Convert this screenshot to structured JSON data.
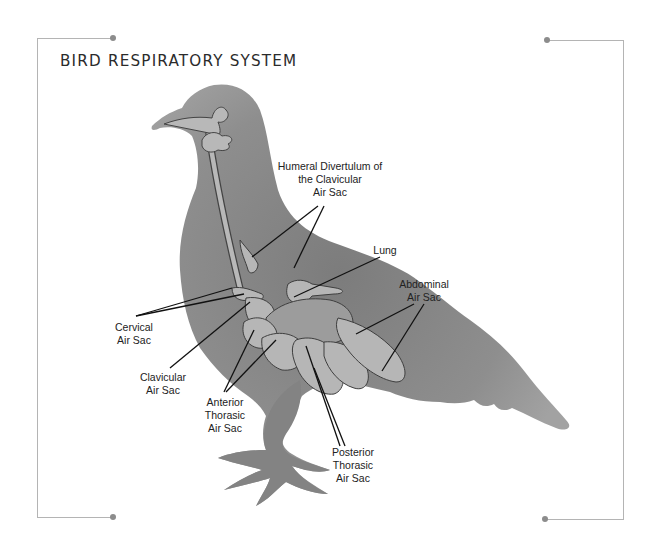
{
  "title": "BIRD RESPIRATORY SYSTEM",
  "colors": {
    "bird_body": "#8e8e8e",
    "bird_dark": "#7a7a7a",
    "air_sac_fill": "#b4b4b4",
    "outline": "#444444",
    "leader_line": "#111111",
    "frame": "#b4b4b4",
    "frame_dot": "#8c8c8c"
  },
  "labels": {
    "humeral": [
      "Humeral Divertulum of",
      "the Clavicular",
      "Air Sac"
    ],
    "lung": [
      "Lung"
    ],
    "abdominal": [
      "Abdominal",
      "Air Sac"
    ],
    "cervical": [
      "Cervical",
      "Air Sac"
    ],
    "clavicular": [
      "Clavicular",
      "Air Sac"
    ],
    "anterior_thoracic": [
      "Anterior",
      "Thorasic",
      "Air Sac"
    ],
    "posterior_thoracic": [
      "Posterior",
      "Thorasic",
      "Air Sac"
    ]
  }
}
